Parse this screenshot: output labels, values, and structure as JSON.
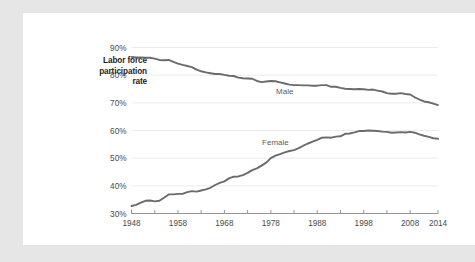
{
  "chart_data": {
    "type": "line",
    "title": "",
    "subtitle": "",
    "xlabel": "",
    "ylabel": "Labor force participation rate",
    "ylabel_lines": [
      "Labor force",
      "participation",
      "rate"
    ],
    "xlim": [
      1948,
      2014
    ],
    "ylim": [
      30,
      90
    ],
    "ytick_labels": [
      "90%",
      "80%",
      "70%",
      "60%",
      "50%",
      "40%",
      "30%"
    ],
    "ytick_values": [
      90,
      80,
      70,
      60,
      50,
      40,
      30
    ],
    "xtick_labels": [
      "1948",
      "1958",
      "1968",
      "1978",
      "1988",
      "1998",
      "2008",
      "2014"
    ],
    "xtick_values": [
      1948,
      1958,
      1968,
      1978,
      1988,
      1998,
      2008,
      2014
    ],
    "minor_xtick_values": [
      1953,
      1963,
      1973,
      1983,
      1993,
      2003
    ],
    "grid": "horizontal",
    "legend_position": "inline-annotation",
    "annotations": [
      {
        "text": "Male",
        "x": 1981,
        "y": 73.2
      },
      {
        "text": "Female",
        "x": 1979,
        "y": 54.6
      }
    ],
    "line_color": "#6b6b6b",
    "gridline_color": "#e4e4e4",
    "axis_color": "#8a8a8a",
    "background_color": "#ffffff",
    "page_background_color": "#e6e6e6",
    "x": [
      1948,
      1949,
      1950,
      1951,
      1952,
      1953,
      1954,
      1955,
      1956,
      1957,
      1958,
      1959,
      1960,
      1961,
      1962,
      1963,
      1964,
      1965,
      1966,
      1967,
      1968,
      1969,
      1970,
      1971,
      1972,
      1973,
      1974,
      1975,
      1976,
      1977,
      1978,
      1979,
      1980,
      1981,
      1982,
      1983,
      1984,
      1985,
      1986,
      1987,
      1988,
      1989,
      1990,
      1991,
      1992,
      1993,
      1994,
      1995,
      1996,
      1997,
      1998,
      1999,
      2000,
      2001,
      2002,
      2003,
      2004,
      2005,
      2006,
      2007,
      2008,
      2009,
      2010,
      2011,
      2012,
      2013,
      2014
    ],
    "series": [
      {
        "name": "Male",
        "values": [
          86.6,
          86.4,
          86.4,
          86.3,
          86.3,
          86.0,
          85.5,
          85.4,
          85.5,
          84.8,
          84.2,
          83.7,
          83.3,
          82.9,
          82.0,
          81.4,
          81.0,
          80.7,
          80.4,
          80.4,
          80.1,
          79.8,
          79.7,
          79.1,
          78.9,
          78.8,
          78.7,
          77.9,
          77.5,
          77.7,
          77.9,
          77.8,
          77.4,
          77.0,
          76.6,
          76.4,
          76.4,
          76.3,
          76.3,
          76.2,
          76.2,
          76.4,
          76.4,
          75.8,
          75.8,
          75.4,
          75.1,
          75.0,
          74.9,
          75.0,
          74.9,
          74.7,
          74.8,
          74.4,
          74.1,
          73.5,
          73.3,
          73.3,
          73.5,
          73.2,
          73.0,
          72.0,
          71.2,
          70.5,
          70.2,
          69.7,
          69.2
        ]
      },
      {
        "name": "Female",
        "values": [
          32.7,
          33.1,
          33.9,
          34.6,
          34.7,
          34.4,
          34.6,
          35.7,
          36.9,
          36.9,
          37.1,
          37.1,
          37.7,
          38.1,
          37.9,
          38.3,
          38.7,
          39.3,
          40.3,
          41.1,
          41.6,
          42.7,
          43.3,
          43.4,
          43.9,
          44.7,
          45.7,
          46.3,
          47.3,
          48.4,
          50.0,
          50.9,
          51.5,
          52.1,
          52.6,
          52.9,
          53.6,
          54.5,
          55.3,
          56.0,
          56.6,
          57.4,
          57.5,
          57.4,
          57.8,
          57.9,
          58.8,
          58.9,
          59.3,
          59.8,
          59.8,
          60.0,
          59.9,
          59.8,
          59.6,
          59.5,
          59.2,
          59.3,
          59.4,
          59.3,
          59.5,
          59.2,
          58.6,
          58.1,
          57.7,
          57.2,
          57.0
        ]
      }
    ]
  }
}
